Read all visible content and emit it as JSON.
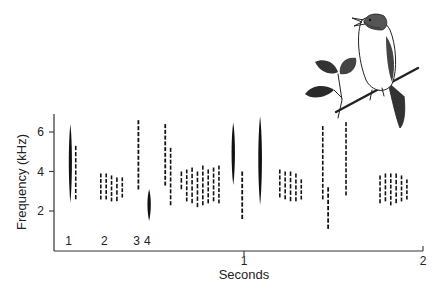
{
  "chart_data": {
    "type": "heatmap",
    "subtype": "spectrogram",
    "title": "",
    "xlabel": "Seconds",
    "ylabel": "Frequency (kHz)",
    "xlim": [
      0,
      2
    ],
    "ylim": [
      0,
      7
    ],
    "x_ticks": [
      {
        "value": 1,
        "label": "1"
      },
      {
        "value": 2,
        "label": "2"
      }
    ],
    "y_ticks": [
      {
        "value": 2,
        "label": "2"
      },
      {
        "value": 4,
        "label": "4"
      },
      {
        "value": 6,
        "label": "6"
      }
    ],
    "grid": false,
    "legend": null,
    "note_labels": [
      {
        "label": "1",
        "time": 0.02
      },
      {
        "label": "2",
        "time": 0.22
      },
      {
        "label": "3",
        "time": 0.4
      },
      {
        "label": "4",
        "time": 0.46
      }
    ],
    "syllables": [
      {
        "t": 0.03,
        "f_low": 2.4,
        "f_high": 6.4,
        "w": 0.012
      },
      {
        "t": 0.06,
        "f_low": 2.5,
        "f_high": 5.3,
        "w": 0.008
      },
      {
        "t": 0.2,
        "f_low": 2.5,
        "f_high": 3.9,
        "w": 0.006
      },
      {
        "t": 0.23,
        "f_low": 2.5,
        "f_high": 3.9,
        "w": 0.006
      },
      {
        "t": 0.26,
        "f_low": 2.4,
        "f_high": 3.8,
        "w": 0.006
      },
      {
        "t": 0.29,
        "f_low": 2.4,
        "f_high": 3.7,
        "w": 0.006
      },
      {
        "t": 0.32,
        "f_low": 2.6,
        "f_high": 3.7,
        "w": 0.006
      },
      {
        "t": 0.41,
        "f_low": 3.0,
        "f_high": 6.6,
        "w": 0.01
      },
      {
        "t": 0.47,
        "f_low": 1.5,
        "f_high": 3.1,
        "w": 0.014
      },
      {
        "t": 0.56,
        "f_low": 3.2,
        "f_high": 6.4,
        "w": 0.01
      },
      {
        "t": 0.59,
        "f_low": 2.2,
        "f_high": 5.2,
        "w": 0.006
      },
      {
        "t": 0.65,
        "f_low": 3.0,
        "f_high": 4.0,
        "w": 0.005
      },
      {
        "t": 0.68,
        "f_low": 2.4,
        "f_high": 4.1,
        "w": 0.006
      },
      {
        "t": 0.71,
        "f_low": 2.3,
        "f_high": 4.2,
        "w": 0.006
      },
      {
        "t": 0.74,
        "f_low": 2.1,
        "f_high": 4.0,
        "w": 0.006
      },
      {
        "t": 0.77,
        "f_low": 2.2,
        "f_high": 4.3,
        "w": 0.007
      },
      {
        "t": 0.8,
        "f_low": 2.3,
        "f_high": 4.1,
        "w": 0.006
      },
      {
        "t": 0.83,
        "f_low": 2.4,
        "f_high": 4.2,
        "w": 0.007
      },
      {
        "t": 0.86,
        "f_low": 2.3,
        "f_high": 4.3,
        "w": 0.006
      },
      {
        "t": 0.94,
        "f_low": 3.3,
        "f_high": 6.5,
        "w": 0.014
      },
      {
        "t": 0.99,
        "f_low": 1.5,
        "f_high": 4.0,
        "w": 0.01
      },
      {
        "t": 1.09,
        "f_low": 2.3,
        "f_high": 6.8,
        "w": 0.016
      },
      {
        "t": 1.2,
        "f_low": 2.6,
        "f_high": 4.1,
        "w": 0.005
      },
      {
        "t": 1.23,
        "f_low": 2.5,
        "f_high": 4.0,
        "w": 0.008
      },
      {
        "t": 1.26,
        "f_low": 2.4,
        "f_high": 4.0,
        "w": 0.006
      },
      {
        "t": 1.29,
        "f_low": 2.4,
        "f_high": 3.9,
        "w": 0.006
      },
      {
        "t": 1.32,
        "f_low": 2.5,
        "f_high": 3.6,
        "w": 0.007
      },
      {
        "t": 1.44,
        "f_low": 2.5,
        "f_high": 6.3,
        "w": 0.008
      },
      {
        "t": 1.47,
        "f_low": 1.0,
        "f_high": 3.2,
        "w": 0.01
      },
      {
        "t": 1.57,
        "f_low": 2.7,
        "f_high": 6.5,
        "w": 0.008
      },
      {
        "t": 1.76,
        "f_low": 2.3,
        "f_high": 3.8,
        "w": 0.005
      },
      {
        "t": 1.79,
        "f_low": 2.4,
        "f_high": 3.9,
        "w": 0.006
      },
      {
        "t": 1.82,
        "f_low": 2.2,
        "f_high": 3.9,
        "w": 0.006
      },
      {
        "t": 1.85,
        "f_low": 2.3,
        "f_high": 3.9,
        "w": 0.006
      },
      {
        "t": 1.88,
        "f_low": 2.4,
        "f_high": 3.8,
        "w": 0.006
      },
      {
        "t": 1.91,
        "f_low": 2.5,
        "f_high": 3.6,
        "w": 0.006
      }
    ],
    "illustration": "songbird-perched-on-branch"
  }
}
